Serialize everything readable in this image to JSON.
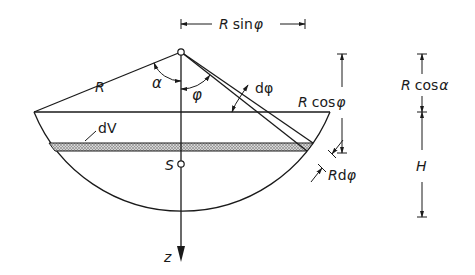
{
  "diagram": {
    "type": "spherical-segment-geometry",
    "colors": {
      "line": "#1a1a1a",
      "background": "#ffffff",
      "strip_fill": "#b8b8b8"
    },
    "labels": {
      "radius": "R",
      "alpha": "α",
      "phi": "φ",
      "dphi": "dφ",
      "dV": "dV",
      "centroid": "S",
      "z_axis": "z",
      "R_sin_phi_R": "R",
      "R_sin_phi_fn": "sin",
      "R_sin_phi_var": "φ",
      "R_cos_phi_R": "R",
      "R_cos_phi_fn": "cos",
      "R_cos_phi_var": "φ",
      "R_cos_alpha_R": "R",
      "R_cos_alpha_fn": "cos",
      "R_cos_alpha_var": "α",
      "R_dphi_R": "R",
      "R_dphi_d": "d",
      "R_dphi_var": "φ",
      "H": "H"
    },
    "dimensions": [
      {
        "name": "R sin φ",
        "orientation": "horizontal"
      },
      {
        "name": "R cos φ",
        "orientation": "vertical"
      },
      {
        "name": "R cos α",
        "orientation": "vertical"
      },
      {
        "name": "H",
        "orientation": "vertical"
      },
      {
        "name": "R dφ",
        "orientation": "oblique"
      }
    ]
  }
}
